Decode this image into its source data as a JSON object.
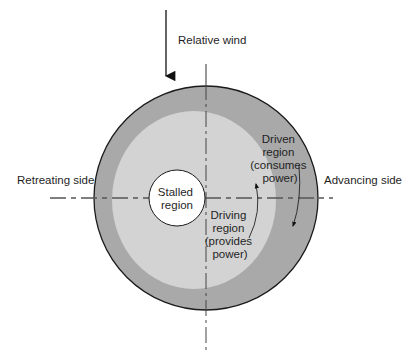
{
  "diagram": {
    "labels": {
      "relative_wind": "Relative wind",
      "retreating_side": "Retreating side",
      "advancing_side": "Advancing side",
      "stalled_region": [
        "Stalled",
        "region"
      ],
      "driven_region": [
        "Driven",
        "region",
        "(consumes",
        "power)"
      ],
      "driving_region": [
        "Driving",
        "region",
        "(provides",
        "power)"
      ]
    },
    "colors": {
      "background": "#ffffff",
      "driven_region_fill": "#a9a9a9",
      "driving_region_fill": "#d3d3d3",
      "stalled_region_fill": "#ffffff",
      "outline": "#1a1a1a",
      "axis_line": "#555555"
    },
    "icons": {
      "wind_arrow": "arrow-down-icon",
      "inner_rotation_arrow": "curved-arrow-up-icon",
      "outer_rotation_arrow": "curved-arrow-down-icon"
    }
  }
}
